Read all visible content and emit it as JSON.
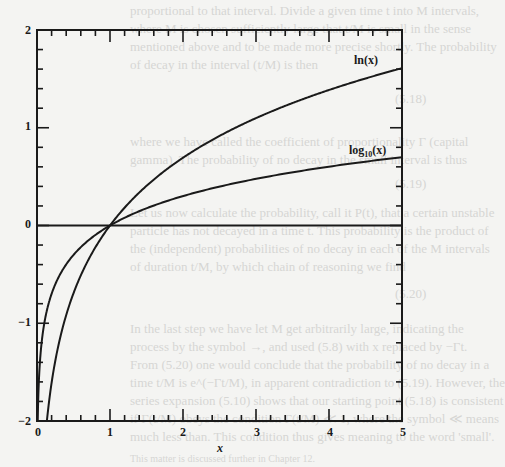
{
  "background_text": {
    "lines": [
      "proportional to that interval. Divide a given time t into M intervals,",
      "where M is chosen sufficiently large that t/M is small in the sense",
      "mentioned above and to be made more precise shortly. The probability",
      "of decay in the interval (t/M) is then",
      "where we have called the coefficient of proportionality Γ (capital",
      "gamma). The probability of no decay in the small interval is thus",
      "Let us now calculate the probability, call it P(t), that a certain unstable",
      "particle has not decayed in a time t. This probability is the product of",
      "the (independent) probabilities of no decay in each of the M intervals",
      "of duration t/M, by which chain of reasoning we find",
      "In the last step we have let M get arbitrarily large, indicating the",
      "process by the symbol →, and used (5.8) with x replaced by −Γt.",
      "From (5.20) one would conclude that the probability of no decay in a",
      "time t/M is e^(−Γt/M), in apparent contradiction to (5.19). However, the",
      "series expansion (5.10) shows that our starting point (5.18) is consistent",
      "if Γ(t/M) obeys the condition Γ(t/M) ≪ 1, where the symbol ≪ means",
      "much less than. This condition thus gives meaning to the word 'small'.",
      "This matter is discussed further in Chapter 12."
    ],
    "equation_numbers": [
      "(5.18)",
      "(5.19)",
      "(5.20)"
    ]
  },
  "chart_data": {
    "type": "line",
    "title": "",
    "xlabel": "x",
    "ylabel": "",
    "xlim": [
      0,
      5
    ],
    "ylim": [
      -2,
      2
    ],
    "grid": false,
    "legend": "inline labels at curve ends",
    "x_ticks": [
      "0",
      "1",
      "2",
      "3",
      "4",
      "5"
    ],
    "y_ticks": [
      "-2",
      "-1",
      "0",
      "1",
      "2"
    ],
    "minor_ticks": {
      "x_per_major": 5,
      "y_per_major": 5
    },
    "horizontal_reference_line": 0,
    "series": [
      {
        "name": "ln(x)",
        "label": "ln(x)",
        "x": [
          0.135,
          0.2,
          0.3,
          0.5,
          0.75,
          1,
          1.5,
          2,
          2.5,
          3,
          3.5,
          4,
          4.5,
          5
        ],
        "values": [
          -2.0,
          -1.609,
          -1.204,
          -0.693,
          -0.288,
          0,
          0.405,
          0.693,
          0.916,
          1.099,
          1.253,
          1.386,
          1.504,
          1.609
        ]
      },
      {
        "name": "log10(x)",
        "label": "log10(x)",
        "x": [
          0.01,
          0.02,
          0.05,
          0.1,
          0.2,
          0.3,
          0.5,
          0.75,
          1,
          1.5,
          2,
          2.5,
          3,
          3.5,
          4,
          4.5,
          5
        ],
        "values": [
          -2.0,
          -1.699,
          -1.301,
          -1.0,
          -0.699,
          -0.523,
          -0.301,
          -0.125,
          0,
          0.176,
          0.301,
          0.398,
          0.477,
          0.544,
          0.602,
          0.653,
          0.699
        ]
      }
    ]
  },
  "labels": {
    "ln": "ln(x)",
    "log10_base": "log",
    "log10_sub": "10",
    "log10_arg": "(x)",
    "xlabel": "x",
    "xticks": [
      "0",
      "1",
      "2",
      "3",
      "4",
      "5"
    ],
    "yticks": [
      "2",
      "1",
      "0",
      "−1",
      "−2"
    ]
  },
  "colors": {
    "ink": "#1a1a1a",
    "paper": "#f4f4f2",
    "bleed": "#d6d6d4"
  }
}
